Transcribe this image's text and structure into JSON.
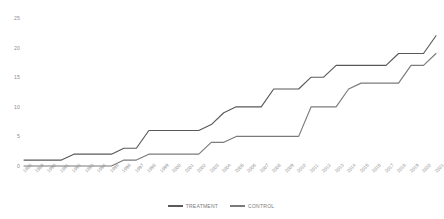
{
  "chart_data": {
    "type": "line",
    "title": "",
    "xlabel": "",
    "ylabel": "",
    "ylim": [
      0,
      25
    ],
    "yticks": [
      0,
      5,
      10,
      15,
      20,
      25
    ],
    "grid": false,
    "legend_position": "bottom",
    "categories": [
      "1988",
      "1989",
      "1990",
      "1991",
      "1992",
      "1993",
      "1994",
      "1995",
      "1996",
      "1997",
      "1998",
      "1999",
      "2000",
      "2001",
      "2002",
      "2003",
      "2004",
      "2005",
      "2006",
      "2007",
      "2008",
      "2009",
      "2010",
      "2011",
      "2012",
      "2013",
      "2014",
      "2015",
      "2016",
      "2017",
      "2018",
      "2019",
      "2020",
      "2021"
    ],
    "series": [
      {
        "name": "TREATMENT",
        "color": "#595959",
        "values": [
          1,
          1,
          1,
          1,
          2,
          2,
          2,
          2,
          3,
          3,
          6,
          6,
          6,
          6,
          6,
          7,
          9,
          10,
          10,
          10,
          13,
          13,
          13,
          15,
          15,
          17,
          17,
          17,
          17,
          17,
          19,
          19,
          19,
          22
        ]
      },
      {
        "name": "CONTROL",
        "color": "#7b7b7b",
        "values": [
          0,
          0,
          0,
          0,
          0,
          0,
          0,
          0,
          1,
          1,
          2,
          2,
          2,
          2,
          2,
          4,
          4,
          5,
          5,
          5,
          5,
          5,
          5,
          10,
          10,
          10,
          13,
          14,
          14,
          14,
          14,
          17,
          17,
          19
        ]
      }
    ]
  },
  "legend": {
    "items": [
      {
        "label": "TREATMENT"
      },
      {
        "label": "CONTROL"
      }
    ]
  }
}
